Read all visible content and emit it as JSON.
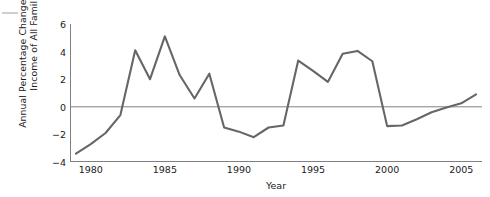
{
  "figure": {
    "background_color": "#ffffff",
    "line_color": "#666666",
    "axis_color": "#808080",
    "zero_line_color": "#808080"
  },
  "chart_data": {
    "type": "line",
    "title": "",
    "xlabel": "Year",
    "ylabel": "Annual Percentage Change in Median Income of All Families",
    "ylabel_line1": "Annual Percentage Change in Median",
    "ylabel_line2": "Income of All Families",
    "xlim": [
      1978.6,
      2006.4
    ],
    "ylim": [
      -4,
      6
    ],
    "xticks": [
      1980,
      1985,
      1990,
      1995,
      2000,
      2005
    ],
    "xtick_labels": [
      "1980",
      "1985",
      "1990",
      "1995",
      "2000",
      "2005"
    ],
    "yticks": [
      6,
      4,
      2,
      0,
      -2,
      -4
    ],
    "ytick_labels": [
      "6",
      "4",
      "2",
      "0",
      "−2",
      "−4"
    ],
    "grid": false,
    "legend": false,
    "zero_reference_line": 0,
    "series": [
      {
        "name": "Annual percentage change in median income of all families",
        "x": [
          1979,
          1980,
          1981,
          1982,
          1983,
          1984,
          1985,
          1986,
          1987,
          1988,
          1989,
          1990,
          1991,
          1992,
          1993,
          1994,
          1995,
          1996,
          1997,
          1998,
          1999,
          2000,
          2001,
          2002,
          2003,
          2004,
          2005,
          2006
        ],
        "values": [
          -3.4,
          -2.7,
          -1.9,
          -0.6,
          4.1,
          2.0,
          5.1,
          2.3,
          0.6,
          2.4,
          -1.5,
          -1.8,
          -2.2,
          -1.5,
          -1.35,
          3.35,
          2.6,
          1.8,
          3.85,
          4.05,
          3.3,
          -1.4,
          -1.35,
          -0.9,
          -0.4,
          -0.05,
          0.25,
          0.9
        ]
      }
    ]
  }
}
